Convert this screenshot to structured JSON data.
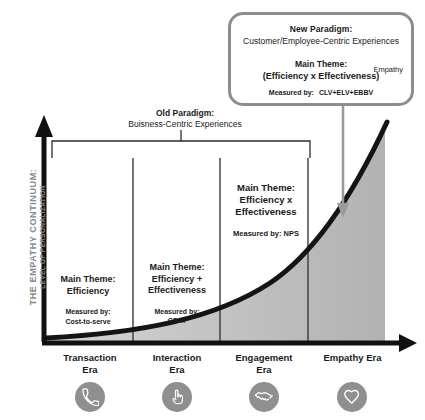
{
  "chart_data": {
    "type": "area",
    "title": "THE EMPATHY CONTINUUM: LEVEL OF PERSONALIZATION",
    "xlabel": "",
    "ylabel": "LEVEL OF PERSONALIZATION",
    "grid": false,
    "legend": "none",
    "categories": [
      "Transaction Era",
      "Interaction Era",
      "Engagement Era",
      "Empathy Era"
    ],
    "series": [
      {
        "name": "Level of Personalization",
        "values": [
          4,
          10,
          28,
          100
        ],
        "curve": "exponential"
      }
    ],
    "x": [
      0,
      1,
      2,
      3
    ],
    "ylim": [
      0,
      100
    ],
    "xlim": [
      0,
      3
    ],
    "annotations": [
      "Old Paradigm: Buisness-Centric Experiences spans the Transaction, Interaction and Engagement eras",
      "New Paradigm: Customer/Employee-Centric Experiences points at the Empathy Era"
    ]
  },
  "axis": {
    "y_caption_line1": "THE EMPATHY CONTINUUM:",
    "y_caption_line2": "LEVEL OF PERSONALIZATION"
  },
  "callout": {
    "title": "New Paradigm:",
    "subtitle": "Customer/Employee-Centric Experiences",
    "theme_label": "Main Theme:",
    "theme_formula": "(Efficiency x Effectiveness)",
    "empathy_tag": "Empathy",
    "measured_label": "Measured by:",
    "measured_value": "CLV+ELV+EBBV",
    "border_color": "#8d8d8d"
  },
  "old_paradigm": {
    "title": "Old Paradigm:",
    "subtitle": "Buisness-Centric Experiences"
  },
  "columns": [
    {
      "theme_label": "Main Theme:",
      "theme_value": "Efficiency",
      "measured_label": "Measured by:",
      "measured_value": "Cost-to-serve"
    },
    {
      "theme_label": "Main Theme:",
      "theme_value": "Efficiency +\nEffectiveness",
      "measured_label": "Measured by:",
      "measured_value": "CSAT"
    },
    {
      "theme_label": "Main Theme:",
      "theme_value": "Efficiency x\nEffectiveness",
      "measured_label": "Measured by: NPS",
      "measured_value": ""
    }
  ],
  "eras": [
    {
      "label": "Transaction\nEra",
      "icon": "phone-icon"
    },
    {
      "label": "Interaction\nEra",
      "icon": "touch-finger-icon"
    },
    {
      "label": "Engagement\nEra",
      "icon": "handshake-icon"
    },
    {
      "label": "Empathy Era",
      "icon": "heart-icon"
    }
  ],
  "colors": {
    "curve": "#141414",
    "area_fill": "#b9b9b9",
    "axis": "#111111",
    "icon_circle": "#8f8f8f",
    "muted_text": "#8a8a8a"
  }
}
